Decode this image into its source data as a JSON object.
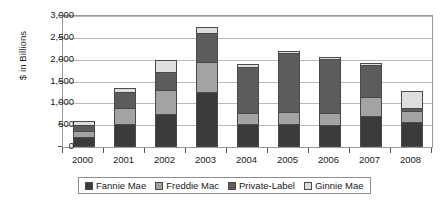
{
  "chart_data": {
    "type": "bar",
    "stacked": true,
    "title": "",
    "xlabel": "",
    "ylabel": "$ in Billions",
    "ylim": [
      0,
      3000
    ],
    "yticks": [
      "0",
      "500",
      "1,000",
      "1,500",
      "2,000",
      "2,500",
      "3,000"
    ],
    "ytick_values": [
      0,
      500,
      1000,
      1500,
      2000,
      2500,
      3000
    ],
    "grid": true,
    "legend_position": "bottom",
    "categories": [
      "2000",
      "2001",
      "2002",
      "2003",
      "2004",
      "2005",
      "2006",
      "2007",
      "2008"
    ],
    "series": [
      {
        "name": "Fannie Mae",
        "color": "#3a3a3a",
        "values": [
          240,
          530,
          750,
          1250,
          530,
          530,
          500,
          700,
          570
        ]
      },
      {
        "name": "Freddie Mac",
        "color": "#a3a3a3",
        "values": [
          130,
          370,
          550,
          700,
          250,
          270,
          280,
          450,
          260
        ]
      },
      {
        "name": "Private-Label",
        "color": "#5c5c5c",
        "values": [
          130,
          370,
          420,
          650,
          1050,
          1350,
          1240,
          720,
          70
        ]
      },
      {
        "name": "Ginnie Mae",
        "color": "#dedede",
        "values": [
          100,
          80,
          280,
          150,
          70,
          50,
          40,
          60,
          380
        ]
      }
    ],
    "totals": [
      600,
      1350,
      2000,
      2750,
      1900,
      2200,
      2060,
      1930,
      1280
    ]
  },
  "legend": {
    "items": [
      {
        "label": "Fannie Mae",
        "color": "#3a3a3a"
      },
      {
        "label": "Freddie Mac",
        "color": "#a3a3a3"
      },
      {
        "label": "Private-Label",
        "color": "#5c5c5c"
      },
      {
        "label": "Ginnie Mae",
        "color": "#dedede"
      }
    ]
  }
}
